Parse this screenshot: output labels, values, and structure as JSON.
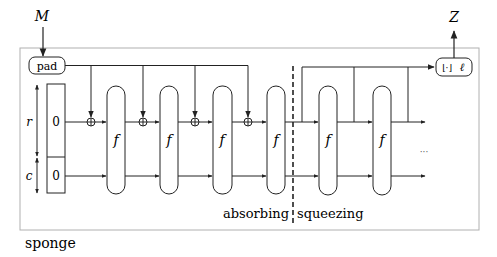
{
  "diagram": {
    "title": "sponge",
    "input_label": "M",
    "output_label": "Z",
    "pad_label": "pad",
    "truncate_label": "⌊·⌋ℓ",
    "trunc_bar": "⌊·⌋",
    "trunc_ell": "ℓ",
    "rate_label": "r",
    "capacity_label": "c",
    "state_init_r": "0",
    "state_init_c": "0",
    "function_label": "f",
    "phase_absorbing": "absorbing",
    "phase_squeezing": "squeezing",
    "ellipsis": "···",
    "absorbing_rounds": 4,
    "squeezing_rounds": 2,
    "colors": {
      "line": "#222222",
      "frame": "#b0b0b0",
      "background": "#ffffff"
    }
  }
}
